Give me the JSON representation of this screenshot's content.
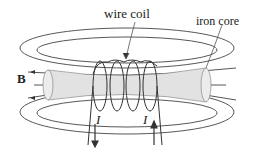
{
  "diagram": {
    "labels": {
      "wire_coil": "wire coil",
      "iron_core": "iron core",
      "field": "B",
      "current_left": "I",
      "current_right": "I"
    },
    "colors": {
      "line": "#333333",
      "core_fill": "#e2e2e2",
      "background": "#ffffff"
    }
  }
}
